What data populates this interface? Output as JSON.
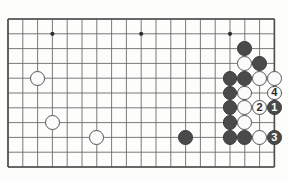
{
  "figure": {
    "kind": "go-board-diagram",
    "title": "",
    "background_color": "#fdfdfc",
    "line_color": "#6b6b6b",
    "border_color": "#4d4d4d",
    "black_stone_color": "#4a4a4a",
    "white_stone_color": "#fbfbfb",
    "stone_outline_color": "#545454"
  },
  "grid": {
    "origin_x": 8,
    "origin_y": 19,
    "spacing": 14.8,
    "columns": 19,
    "rows": 11,
    "stone_radius": 7.4
  },
  "star_points": [
    {
      "name": "star-point-left-top",
      "col": 3,
      "row": 1
    },
    {
      "name": "star-point-center-top",
      "col": 9,
      "row": 1
    },
    {
      "name": "star-point-right-top",
      "col": 15,
      "row": 1
    },
    {
      "name": "star-point-center-bottom",
      "col": 12,
      "row": 8
    }
  ],
  "stones": [
    {
      "id": "w-left-upper",
      "color": "white",
      "col": 2,
      "row": 4,
      "label": ""
    },
    {
      "id": "w-left-lower",
      "color": "white",
      "col": 3,
      "row": 7,
      "label": ""
    },
    {
      "id": "w-left-bottom",
      "color": "white",
      "col": 6,
      "row": 8,
      "label": ""
    },
    {
      "id": "b-center",
      "color": "black",
      "col": 12,
      "row": 8,
      "label": ""
    },
    {
      "id": "b-r15c2",
      "color": "black",
      "col": 16,
      "row": 2,
      "label": ""
    },
    {
      "id": "w-r16c3",
      "color": "white",
      "col": 16,
      "row": 3,
      "label": ""
    },
    {
      "id": "b-r17c3",
      "color": "black",
      "col": 17,
      "row": 3,
      "label": ""
    },
    {
      "id": "b-r15c4",
      "color": "black",
      "col": 15,
      "row": 4,
      "label": ""
    },
    {
      "id": "b-r16c4",
      "color": "black",
      "col": 16,
      "row": 4,
      "label": ""
    },
    {
      "id": "w-r17c4",
      "color": "white",
      "col": 17,
      "row": 4,
      "label": ""
    },
    {
      "id": "w-r18c4",
      "color": "white",
      "col": 18,
      "row": 4,
      "label": ""
    },
    {
      "id": "b-r15c5",
      "color": "black",
      "col": 15,
      "row": 5,
      "label": ""
    },
    {
      "id": "w-r16c5",
      "color": "white",
      "col": 16,
      "row": 5,
      "label": ""
    },
    {
      "id": "w-r18c5-move4",
      "color": "white",
      "col": 18,
      "row": 5,
      "label": "4"
    },
    {
      "id": "b-r15c6",
      "color": "black",
      "col": 15,
      "row": 6,
      "label": ""
    },
    {
      "id": "w-r16c6",
      "color": "white",
      "col": 16,
      "row": 6,
      "label": ""
    },
    {
      "id": "w-r17c6-move2",
      "color": "white",
      "col": 17,
      "row": 6,
      "label": "2"
    },
    {
      "id": "b-r18c6-move1",
      "color": "black",
      "col": 18,
      "row": 6,
      "label": "1"
    },
    {
      "id": "b-r15c7",
      "color": "black",
      "col": 15,
      "row": 7,
      "label": ""
    },
    {
      "id": "w-r16c7",
      "color": "white",
      "col": 16,
      "row": 7,
      "label": ""
    },
    {
      "id": "b-r15c8",
      "color": "black",
      "col": 15,
      "row": 8,
      "label": ""
    },
    {
      "id": "b-r16c8",
      "color": "black",
      "col": 16,
      "row": 8,
      "label": ""
    },
    {
      "id": "w-r17c8",
      "color": "white",
      "col": 17,
      "row": 8,
      "label": ""
    },
    {
      "id": "b-r18c8-move3",
      "color": "black",
      "col": 18,
      "row": 8,
      "label": "3"
    }
  ],
  "move_numbers": {
    "1": {
      "label": "1",
      "color": "black"
    },
    "2": {
      "label": "2",
      "color": "white"
    },
    "3": {
      "label": "3",
      "color": "black"
    },
    "4": {
      "label": "4",
      "color": "white"
    }
  }
}
